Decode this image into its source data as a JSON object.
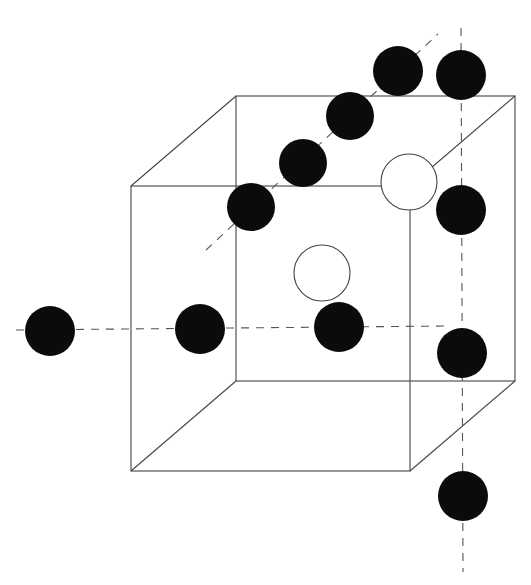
{
  "diagram": {
    "type": "crystal-lattice-cube",
    "colors": {
      "background": "#ffffff",
      "edge": "#444444",
      "filled_atom": "#0b0b0b",
      "hollow_atom_fill": "#ffffff"
    },
    "cube": {
      "front_face": {
        "x1": 131,
        "y1": 186,
        "x2": 410,
        "y2": 471
      },
      "back_face": {
        "x1": 236,
        "y1": 96,
        "x2": 515,
        "y2": 381
      }
    },
    "axes": [
      {
        "name": "horizontal-axis",
        "x1": 16,
        "y1": 330,
        "x2": 448,
        "y2": 326
      },
      {
        "name": "diagonal-axis",
        "x1": 206,
        "y1": 250,
        "x2": 438,
        "y2": 34
      },
      {
        "name": "vertical-axis",
        "x1": 461,
        "y1": 28,
        "x2": 463,
        "y2": 572
      }
    ],
    "filled_atoms": [
      {
        "cx": 50,
        "cy": 331,
        "r": 25
      },
      {
        "cx": 200,
        "cy": 329,
        "r": 25
      },
      {
        "cx": 339,
        "cy": 327,
        "r": 25
      },
      {
        "cx": 251,
        "cy": 207,
        "r": 24
      },
      {
        "cx": 303,
        "cy": 163,
        "r": 24
      },
      {
        "cx": 350,
        "cy": 116,
        "r": 24
      },
      {
        "cx": 398,
        "cy": 71,
        "r": 25
      },
      {
        "cx": 461,
        "cy": 75,
        "r": 25
      },
      {
        "cx": 461,
        "cy": 210,
        "r": 25
      },
      {
        "cx": 462,
        "cy": 353,
        "r": 25
      },
      {
        "cx": 463,
        "cy": 496,
        "r": 25
      }
    ],
    "hollow_atoms": [
      {
        "cx": 409,
        "cy": 182,
        "r": 28
      },
      {
        "cx": 322,
        "cy": 273,
        "r": 28
      }
    ]
  }
}
